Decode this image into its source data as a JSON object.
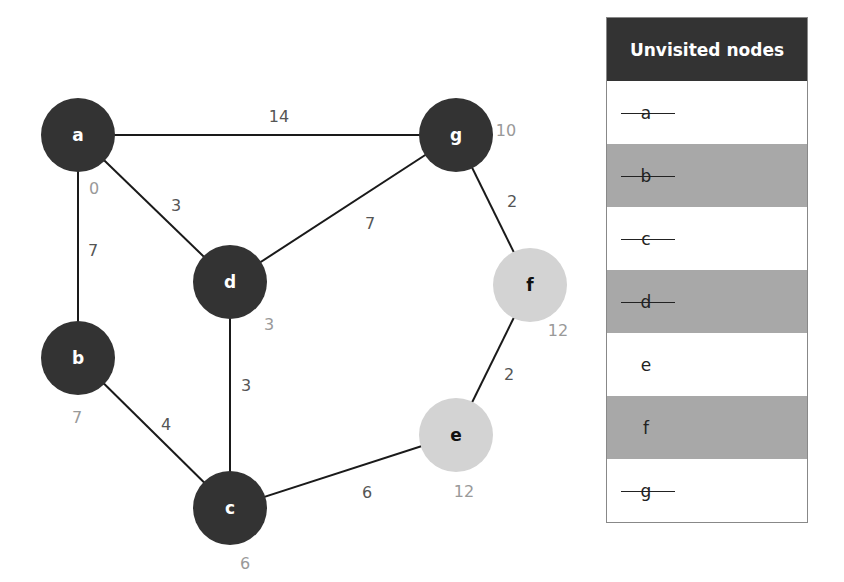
{
  "graph": {
    "nodes": [
      {
        "id": "a",
        "label": "a",
        "x": 78,
        "y": 135,
        "visited": true,
        "distance": "0",
        "dx": 94,
        "dy": 188
      },
      {
        "id": "b",
        "label": "b",
        "x": 78,
        "y": 358,
        "visited": true,
        "distance": "7",
        "dx": 77,
        "dy": 417
      },
      {
        "id": "c",
        "label": "c",
        "x": 230,
        "y": 508,
        "visited": true,
        "distance": "6",
        "dx": 245,
        "dy": 563
      },
      {
        "id": "d",
        "label": "d",
        "x": 230,
        "y": 282,
        "visited": true,
        "distance": "3",
        "dx": 269,
        "dy": 324
      },
      {
        "id": "e",
        "label": "e",
        "x": 456,
        "y": 435,
        "visited": false,
        "distance": "12",
        "dx": 464,
        "dy": 491
      },
      {
        "id": "f",
        "label": "f",
        "x": 530,
        "y": 285,
        "visited": false,
        "distance": "12",
        "dx": 558,
        "dy": 330
      },
      {
        "id": "g",
        "label": "g",
        "x": 456,
        "y": 135,
        "visited": true,
        "distance": "10",
        "dx": 506,
        "dy": 130
      }
    ],
    "edges": [
      {
        "from": "a",
        "to": "g",
        "weight": "14",
        "lx": 279,
        "ly": 116
      },
      {
        "from": "a",
        "to": "d",
        "weight": "3",
        "lx": 176,
        "ly": 205
      },
      {
        "from": "a",
        "to": "b",
        "weight": "7",
        "lx": 93,
        "ly": 250
      },
      {
        "from": "d",
        "to": "g",
        "weight": "7",
        "lx": 370,
        "ly": 223
      },
      {
        "from": "g",
        "to": "f",
        "weight": "2",
        "lx": 512,
        "ly": 201
      },
      {
        "from": "d",
        "to": "c",
        "weight": "3",
        "lx": 246,
        "ly": 385
      },
      {
        "from": "b",
        "to": "c",
        "weight": "4",
        "lx": 166,
        "ly": 424
      },
      {
        "from": "f",
        "to": "e",
        "weight": "2",
        "lx": 509,
        "ly": 374
      },
      {
        "from": "c",
        "to": "e",
        "weight": "6",
        "lx": 367,
        "ly": 492
      }
    ],
    "node_radius": 37,
    "colors": {
      "visited": "#333333",
      "unvisited": "#d3d3d3",
      "edge": "#1a1a1a"
    }
  },
  "table": {
    "title": "Unvisited nodes",
    "rows": [
      {
        "label": "a",
        "struck": true,
        "shaded": false
      },
      {
        "label": "b",
        "struck": true,
        "shaded": true
      },
      {
        "label": "c",
        "struck": true,
        "shaded": false
      },
      {
        "label": "d",
        "struck": true,
        "shaded": true
      },
      {
        "label": "e",
        "struck": false,
        "shaded": false
      },
      {
        "label": "f",
        "struck": false,
        "shaded": true
      },
      {
        "label": "g",
        "struck": true,
        "shaded": false
      }
    ]
  }
}
